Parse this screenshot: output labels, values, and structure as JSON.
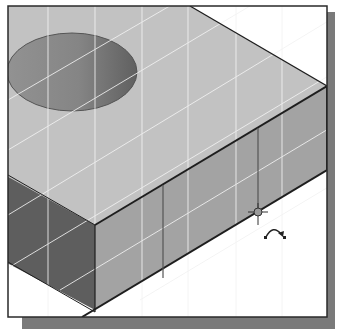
{
  "figure": {
    "colors": {
      "background": "#ffffff",
      "frame_border": "#2a2a2a",
      "frame_shadow": "#7a7a7a",
      "top_face": "#c2c2c2",
      "front_face": "#a3a3a3",
      "left_face": "#5e5e5e",
      "hole_light": "#8c8c8c",
      "hole_dark": "#666666",
      "edge": "#1e1e1e",
      "grid": "#f2f2f2"
    },
    "cursor": {
      "type": "rotate-cursor",
      "x": 258,
      "y": 212
    }
  }
}
